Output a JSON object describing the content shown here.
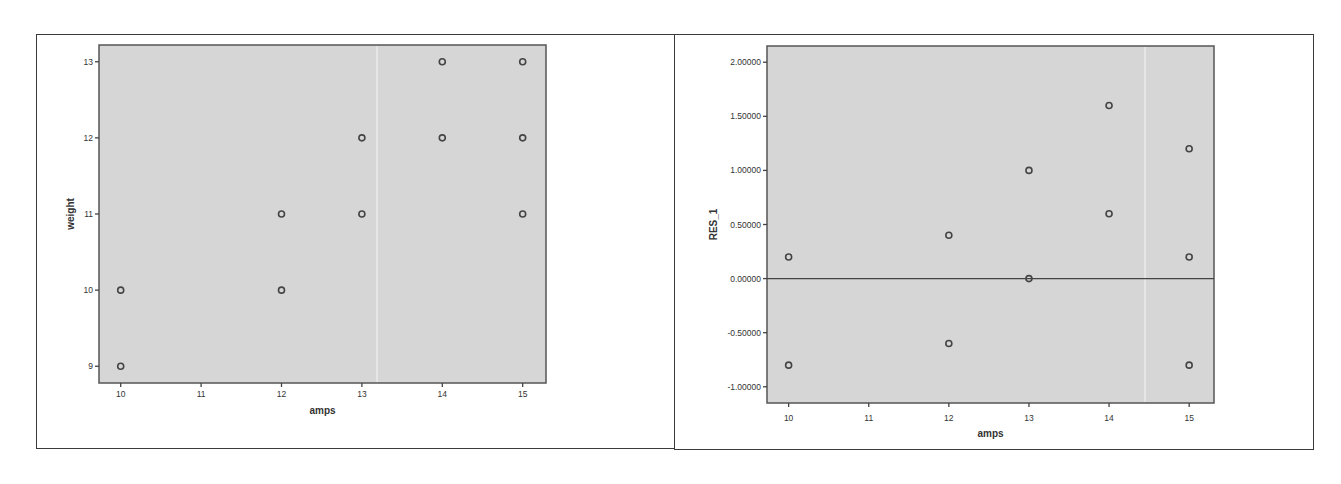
{
  "chart_data": [
    {
      "type": "scatter",
      "title": "",
      "xlabel": "amps",
      "ylabel": "weight",
      "xlim": [
        9.73,
        15.29
      ],
      "ylim": [
        8.78,
        13.22
      ],
      "x_ticks": [
        10,
        11,
        12,
        13,
        14,
        15
      ],
      "x_tick_labels": [
        "10",
        "11",
        "12",
        "13",
        "14",
        "15"
      ],
      "y_ticks": [
        9,
        10,
        11,
        12,
        13
      ],
      "y_tick_labels": [
        "9",
        "10",
        "11",
        "12",
        "13"
      ],
      "grid": false,
      "legend": null,
      "background": "#d6d6d6",
      "points": [
        {
          "x": 10,
          "y": 10
        },
        {
          "x": 10,
          "y": 9
        },
        {
          "x": 12,
          "y": 11
        },
        {
          "x": 12,
          "y": 10
        },
        {
          "x": 13,
          "y": 12
        },
        {
          "x": 13,
          "y": 11
        },
        {
          "x": 14,
          "y": 13
        },
        {
          "x": 14,
          "y": 12
        },
        {
          "x": 15,
          "y": 13
        },
        {
          "x": 15,
          "y": 12
        },
        {
          "x": 15,
          "y": 11
        }
      ]
    },
    {
      "type": "scatter",
      "title": "",
      "xlabel": "amps",
      "ylabel": "RES_1",
      "xlim": [
        9.73,
        15.31
      ],
      "ylim": [
        -1.15,
        2.15
      ],
      "x_ticks": [
        10,
        11,
        12,
        13,
        14,
        15
      ],
      "x_tick_labels": [
        "10",
        "11",
        "12",
        "13",
        "14",
        "15"
      ],
      "y_ticks": [
        2.0,
        1.5,
        1.0,
        0.5,
        0.0,
        -0.5,
        -1.0
      ],
      "y_tick_labels": [
        "2.00000",
        "1.50000",
        "1.00000",
        "0.50000",
        "0.00000",
        "-0.50000",
        "-1.00000"
      ],
      "grid": false,
      "legend": null,
      "background": "#d6d6d6",
      "reference_line": {
        "y": 0.0
      },
      "points": [
        {
          "x": 10,
          "y": 0.2
        },
        {
          "x": 10,
          "y": -0.8
        },
        {
          "x": 12,
          "y": 0.4
        },
        {
          "x": 12,
          "y": -0.6
        },
        {
          "x": 13,
          "y": 1.0
        },
        {
          "x": 13,
          "y": 0.0
        },
        {
          "x": 14,
          "y": 1.6
        },
        {
          "x": 14,
          "y": 0.6
        },
        {
          "x": 15,
          "y": 1.2
        },
        {
          "x": 15,
          "y": 0.2
        },
        {
          "x": 15,
          "y": -0.8
        }
      ]
    }
  ],
  "left": {
    "xlabel": "amps",
    "ylabel": "weight"
  },
  "right": {
    "xlabel": "amps",
    "ylabel": "RES_1"
  }
}
